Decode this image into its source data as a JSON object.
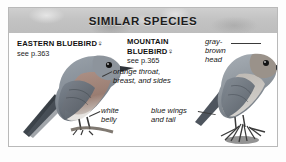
{
  "card": {
    "header_title": "SIMILAR SPECIES"
  },
  "species": [
    {
      "id": "eastern-bluebird",
      "name": "EASTERN BLUEBIRD",
      "sex_symbol": "♀",
      "page_ref": "see p.363"
    },
    {
      "id": "mountain-bluebird",
      "name": "MOUNTAIN BLUEBIRD",
      "sex_symbol": "♀",
      "page_ref": "see p.365"
    }
  ],
  "annotations": [
    {
      "id": "gray-brown-head",
      "text": "gray-brown head"
    },
    {
      "id": "orange-throat",
      "text": "orange throat, breast, and sides"
    },
    {
      "id": "white-belly",
      "text": "white belly"
    },
    {
      "id": "blue-wings",
      "text": "blue wings and tail"
    }
  ],
  "illustrations": [
    {
      "id": "eastern-bluebird-illustration",
      "alt": "perched female Eastern Bluebird, gray-blue above with orange breast"
    },
    {
      "id": "mountain-bluebird-illustration",
      "alt": "perched female Mountain Bluebird on a twig, gray-brown head and blue wings"
    }
  ],
  "colors": {
    "header_band": "#c3c3c3",
    "card_border": "#b9b9b9",
    "text": "#111111",
    "leader_line": "#3a3a3a"
  }
}
